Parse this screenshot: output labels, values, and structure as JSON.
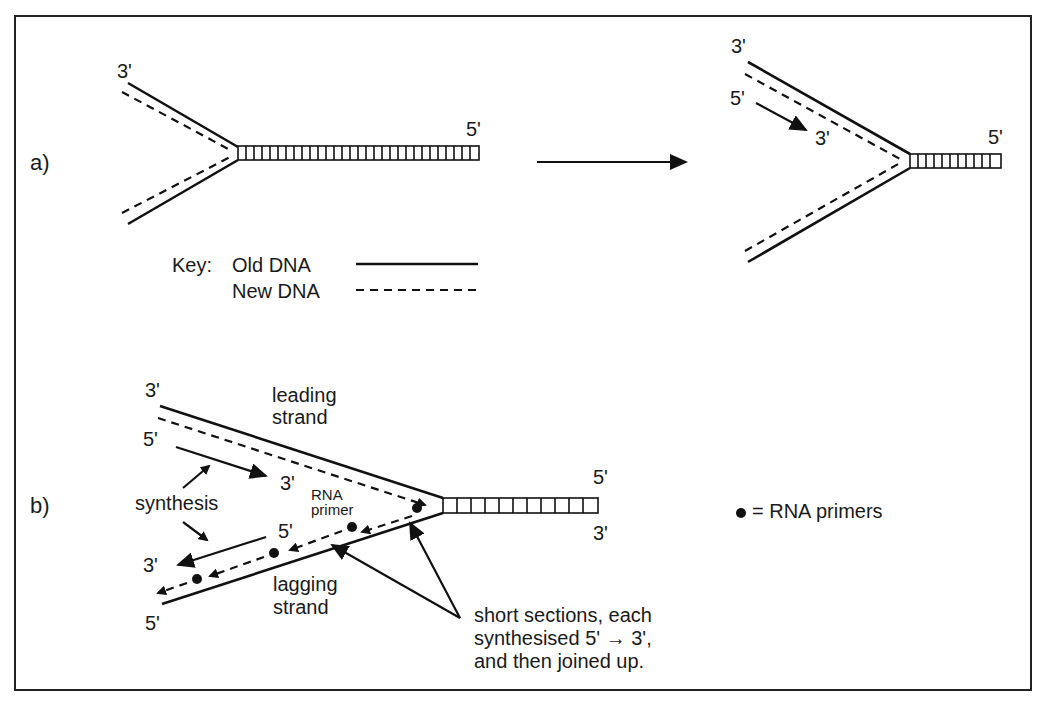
{
  "figure": {
    "panel_a": {
      "label": "a)",
      "before": {
        "top_end": "3'",
        "right_end": "5'"
      },
      "after": {
        "top_end": "3'",
        "new_strand_start": "5'",
        "new_strand_end": "3'",
        "right_end": "5'"
      },
      "key": {
        "prefix": "Key:",
        "old_label": "Old DNA",
        "new_label": "New DNA"
      }
    },
    "panel_b": {
      "label": "b)",
      "top_left_end": "3'",
      "leading_line1": "leading",
      "leading_line2": "strand",
      "leading_new_start": "5'",
      "leading_new_end": "3'",
      "synthesis": "synthesis",
      "rna_primer_line1": "RNA",
      "rna_primer_line2": "primer",
      "lagging_new_start": "5'",
      "lagging_new_end": "3'",
      "lagging_line1": "lagging",
      "lagging_line2": "strand",
      "bottom_left_end": "5'",
      "right_top_end": "5'",
      "right_bottom_end": "3'",
      "legend": "= RNA primers",
      "note_line1": "short sections, each",
      "note_line2": "synthesised 5' → 3',",
      "note_line3": "and then joined up."
    },
    "colors": {
      "ink": "#111111",
      "background": "#ffffff"
    }
  }
}
